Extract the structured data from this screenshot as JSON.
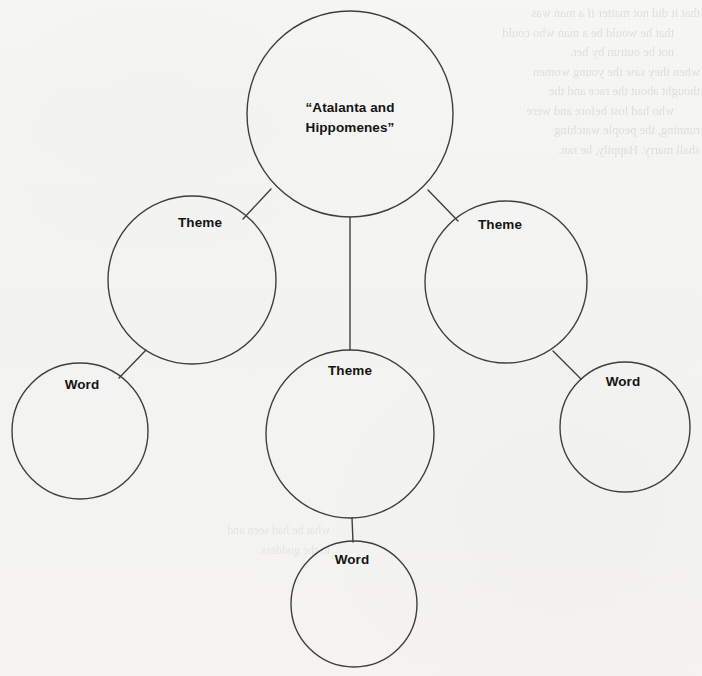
{
  "document": {
    "type": "concept-web-graphic-organizer",
    "page_background_color": "#f4f4f2",
    "stroke_color": "#3f3f3f",
    "text_color": "#141414"
  },
  "diagram": {
    "nodes": [
      {
        "id": "main",
        "role": "central-topic",
        "label": "“Atalanta and\nHippomenes”",
        "cx": 350,
        "cy": 114,
        "r": 103,
        "label_x": 350,
        "label_y": 98,
        "label_class": "lbl-main"
      },
      {
        "id": "theme-left",
        "role": "theme",
        "label": "Theme",
        "cx": 192,
        "cy": 280,
        "r": 84,
        "label_x": 200,
        "label_y": 213,
        "label_class": "lbl-theme"
      },
      {
        "id": "theme-right",
        "role": "theme",
        "label": "Theme",
        "cx": 506,
        "cy": 282,
        "r": 81,
        "label_x": 500,
        "label_y": 215,
        "label_class": "lbl-theme"
      },
      {
        "id": "theme-center",
        "role": "theme",
        "label": "Theme",
        "cx": 350,
        "cy": 434,
        "r": 84,
        "label_x": 350,
        "label_y": 361,
        "label_class": "lbl-theme"
      },
      {
        "id": "word-left",
        "role": "word",
        "label": "Word",
        "cx": 80,
        "cy": 431,
        "r": 68,
        "label_x": 82,
        "label_y": 375,
        "label_class": "lbl-word"
      },
      {
        "id": "word-right",
        "role": "word",
        "label": "Word",
        "cx": 625,
        "cy": 427,
        "r": 65,
        "label_x": 623,
        "label_y": 372,
        "label_class": "lbl-word"
      },
      {
        "id": "word-bottom",
        "role": "word",
        "label": "Word",
        "cx": 354,
        "cy": 604,
        "r": 63,
        "label_x": 352,
        "label_y": 550,
        "label_class": "lbl-word"
      }
    ],
    "connectors": [
      {
        "id": "main-to-theme-left",
        "from": "main",
        "to": "theme-left",
        "x1": 271,
        "y1": 189,
        "x2": 243,
        "y2": 219
      },
      {
        "id": "main-to-theme-right",
        "from": "main",
        "to": "theme-right",
        "x1": 428,
        "y1": 190,
        "x2": 458,
        "y2": 221
      },
      {
        "id": "main-to-theme-center",
        "from": "main",
        "to": "theme-center",
        "x1": 350,
        "y1": 217,
        "x2": 350,
        "y2": 350
      },
      {
        "id": "theme-left-to-word-left",
        "from": "theme-left",
        "to": "word-left",
        "x1": 146,
        "y1": 350,
        "x2": 119,
        "y2": 378
      },
      {
        "id": "theme-right-to-word-right",
        "from": "theme-right",
        "to": "word-right",
        "x1": 553,
        "y1": 351,
        "x2": 581,
        "y2": 379
      },
      {
        "id": "theme-center-to-word-bottom",
        "from": "theme-center",
        "to": "word-bottom",
        "x1": 352,
        "y1": 518,
        "x2": 353,
        "y2": 542
      }
    ]
  },
  "bleed_through": {
    "note": "Faint mirrored show-through text from the reverse side of the page; not legible.",
    "block_top_right": [
      "that it did not matter if a man was",
      "that he would be a man who could",
      "not be outrun by her.",
      "when they saw the young women",
      "thought about the race and the",
      "who had lost before and were",
      "running, the people watching",
      "shall marry. Happily, he ran."
    ],
    "block_bottom_left": [
      "what he had seen and",
      "to the goddess."
    ]
  }
}
